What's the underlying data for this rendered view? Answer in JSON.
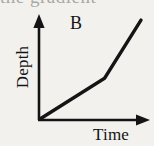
{
  "figure": {
    "caption_sliver": "the gradient",
    "series_label": "B",
    "axes": {
      "y_label": "Depth",
      "x_label": "Time"
    }
  },
  "colors": {
    "background": "#f2f1ee",
    "ink": "#141414",
    "faint_ink": "#8d8d8a"
  },
  "chart_data": {
    "type": "line",
    "title": "B",
    "xlabel": "Time",
    "ylabel": "Depth",
    "xlim": [
      0,
      10
    ],
    "ylim": [
      0,
      10
    ],
    "grid": false,
    "legend": "none",
    "axis_arrows": true,
    "axis_ticks": false,
    "series": [
      {
        "name": "B",
        "x": [
          0,
          6.4,
          10.0
        ],
        "y": [
          0,
          4.0,
          9.7
        ],
        "segments": [
          {
            "name": "shallow-gradient-segment",
            "from": [
              0,
              0
            ],
            "to": [
              6.4,
              4.0
            ],
            "gradient": 0.63
          },
          {
            "name": "steep-gradient-segment",
            "from": [
              6.4,
              4.0
            ],
            "to": [
              10.0,
              9.7
            ],
            "gradient": 1.58
          }
        ]
      }
    ],
    "annotations": [
      {
        "name": "kink-point",
        "x": 6.4,
        "y": 4.0,
        "label": ""
      }
    ]
  }
}
